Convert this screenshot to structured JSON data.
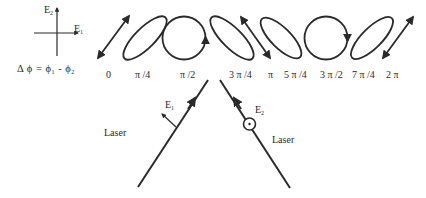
{
  "axes_legend": {
    "vertical_label": "E",
    "vertical_sub": "2",
    "horizontal_label": "E",
    "horizontal_sub": "1",
    "formula": "Δ ϕ = ϕ",
    "formula_sub1": "1",
    "formula_mid": " - ϕ",
    "formula_sub2": "2"
  },
  "polarization_states": [
    {
      "phase": "0",
      "shape": "linear-line",
      "orientation": "+45deg",
      "icon": "double-arrow-line"
    },
    {
      "phase": "π /4",
      "shape": "ellipse",
      "orientation": "+45deg",
      "icon": "ellipse"
    },
    {
      "phase": "π /2",
      "shape": "circle",
      "handedness": "arrow-up-right-side",
      "icon": "circle-arrow"
    },
    {
      "phase": "3 π /4",
      "shape": "ellipse",
      "orientation": "-45deg",
      "icon": "ellipse"
    },
    {
      "phase": "π",
      "shape": "linear-line",
      "orientation": "-45deg",
      "icon": "double-arrow-line"
    },
    {
      "phase": "5 π /4",
      "shape": "ellipse",
      "orientation": "-45deg",
      "icon": "ellipse"
    },
    {
      "phase": "3 π /2",
      "shape": "circle",
      "handedness": "arrow-down-right-side",
      "icon": "circle-arrow"
    },
    {
      "phase": "7 π /4",
      "shape": "ellipse",
      "orientation": "+45deg",
      "icon": "ellipse"
    },
    {
      "phase": "2 π",
      "shape": "linear-line",
      "orientation": "+45deg",
      "icon": "double-arrow-line"
    }
  ],
  "beams": {
    "left": {
      "label": "Laser",
      "field_label": "E",
      "field_sub": "1",
      "field_icon": "in-plane-arrow"
    },
    "right": {
      "label": "Laser",
      "field_label": "E",
      "field_sub": "2",
      "field_icon": "out-of-plane-dot-circle"
    }
  },
  "colors": {
    "stroke": "#2a2a2a",
    "background": "#ffffff"
  }
}
